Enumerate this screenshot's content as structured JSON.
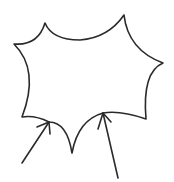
{
  "diagram": {
    "kind": "hand-drawn sketch",
    "background": "#ffffff",
    "stroke_color": "#2a2a2a",
    "shape": {
      "name": "spiky-star-shape",
      "vertices": [
        {
          "label": "top-left-spike",
          "x": 45,
          "y": 23
        },
        {
          "label": "top-right-spike",
          "x": 124,
          "y": 15
        },
        {
          "label": "right-spike",
          "x": 163,
          "y": 63
        },
        {
          "label": "lower-right-corner",
          "x": 146,
          "y": 119
        },
        {
          "label": "right-arrow-target",
          "x": 103,
          "y": 113
        },
        {
          "label": "bottom-spike",
          "x": 72,
          "y": 153
        },
        {
          "label": "left-arrow-target",
          "x": 49,
          "y": 122
        },
        {
          "label": "bottom-left-corner",
          "x": 22,
          "y": 117
        },
        {
          "label": "left-spike",
          "x": 14,
          "y": 44
        }
      ]
    },
    "arrows": [
      {
        "name": "left-arrow",
        "from": {
          "x": 22,
          "y": 163
        },
        "to": {
          "x": 49,
          "y": 122
        }
      },
      {
        "name": "right-arrow",
        "from": {
          "x": 118,
          "y": 178
        },
        "to": {
          "x": 103,
          "y": 113
        }
      }
    ]
  }
}
